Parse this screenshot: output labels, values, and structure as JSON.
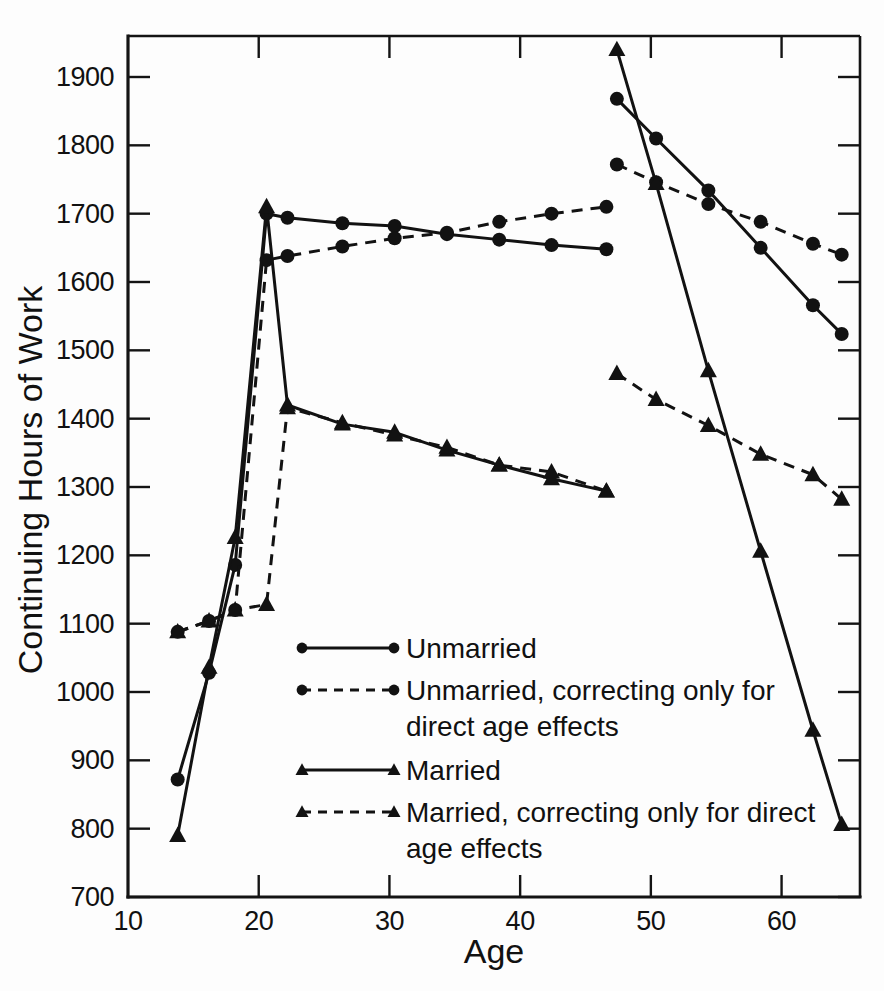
{
  "chart_data": {
    "type": "line",
    "title": "",
    "xlabel": "Age",
    "ylabel": "Continuing Hours of Work",
    "xlim": [
      10,
      66
    ],
    "ylim": [
      700,
      1960
    ],
    "grid": false,
    "legend_position": "center-left-inside",
    "xticks": [
      10,
      20,
      30,
      40,
      50,
      60
    ],
    "xtick_labels": [
      "10",
      "20",
      "30",
      "40",
      "50",
      "60"
    ],
    "yticks": [
      700,
      800,
      900,
      1000,
      1100,
      1200,
      1300,
      1400,
      1500,
      1600,
      1700,
      1800,
      1900
    ],
    "ytick_labels": [
      "700",
      "800",
      "900",
      "1000",
      "1100",
      "1200",
      "1300",
      "1400",
      "1500",
      "1600",
      "1700",
      "1800",
      "1900"
    ],
    "series": [
      {
        "name": "Unmarried",
        "style": "solid",
        "marker": "circle",
        "segments": [
          {
            "x": [
              13.8,
              16.2,
              18.2,
              20.6,
              22.2,
              26.4,
              30.4,
              34.4,
              38.4,
              42.4,
              46.6
            ],
            "y": [
              872,
              1028,
              1186,
              1700,
              1694,
              1686,
              1682,
              1670,
              1662,
              1654,
              1648
            ]
          },
          {
            "x": [
              47.4,
              50.4,
              54.4,
              58.4,
              62.4,
              64.6
            ],
            "y": [
              1868,
              1810,
              1734,
              1650,
              1566,
              1524
            ]
          }
        ]
      },
      {
        "name": "Unmarried, correcting only for direct age effects",
        "style": "dashed",
        "marker": "circle",
        "segments": [
          {
            "x": [
              13.8,
              16.2,
              18.2,
              20.6,
              22.2,
              26.4,
              30.4,
              34.4,
              38.4,
              42.4,
              46.6
            ],
            "y": [
              1088,
              1104,
              1120,
              1632,
              1638,
              1652,
              1664,
              1672,
              1688,
              1700,
              1710
            ]
          },
          {
            "x": [
              47.4,
              50.4,
              54.4,
              58.4,
              62.4,
              64.6
            ],
            "y": [
              1772,
              1746,
              1714,
              1688,
              1656,
              1640
            ]
          }
        ]
      },
      {
        "name": "Married",
        "style": "solid",
        "marker": "triangle",
        "segments": [
          {
            "x": [
              13.8,
              16.2,
              18.2,
              20.6,
              22.2,
              26.4,
              30.4,
              34.4,
              38.4,
              42.4,
              46.6
            ],
            "y": [
              790,
              1036,
              1226,
              1710,
              1420,
              1392,
              1380,
              1354,
              1332,
              1312,
              1294
            ]
          },
          {
            "x": [
              47.4,
              50.4,
              54.4,
              58.4,
              62.4,
              64.6
            ],
            "y": [
              1940,
              1744,
              1470,
              1206,
              944,
              806
            ]
          }
        ]
      },
      {
        "name": "Married, correcting only for direct age effects",
        "style": "dashed",
        "marker": "triangle",
        "segments": [
          {
            "x": [
              13.8,
              16.2,
              18.2,
              20.6,
              22.2,
              26.4,
              30.4,
              34.4,
              38.4,
              42.4,
              46.6
            ],
            "y": [
              1088,
              1104,
              1120,
              1128,
              1416,
              1394,
              1376,
              1358,
              1332,
              1322,
              1294
            ]
          },
          {
            "x": [
              47.4,
              50.4,
              54.4,
              58.4,
              62.4,
              64.6
            ],
            "y": [
              1466,
              1428,
              1390,
              1348,
              1318,
              1282
            ]
          }
        ]
      }
    ]
  },
  "legend": {
    "entries": [
      {
        "label": "Unmarried",
        "style": "solid",
        "marker": "circle",
        "lines": [
          "Unmarried"
        ]
      },
      {
        "label": "Unmarried, correcting only for direct age effects",
        "style": "dashed",
        "marker": "circle",
        "lines": [
          "Unmarried, correcting only for",
          "direct age effects"
        ]
      },
      {
        "label": "Married",
        "style": "solid",
        "marker": "triangle",
        "lines": [
          "Married"
        ]
      },
      {
        "label": "Married, correcting only for direct age effects",
        "style": "dashed",
        "marker": "triangle",
        "lines": [
          "Married, correcting only for direct",
          "age effects"
        ]
      }
    ]
  },
  "colors": {
    "ink": "#121212",
    "background": "#fdfdfd"
  }
}
